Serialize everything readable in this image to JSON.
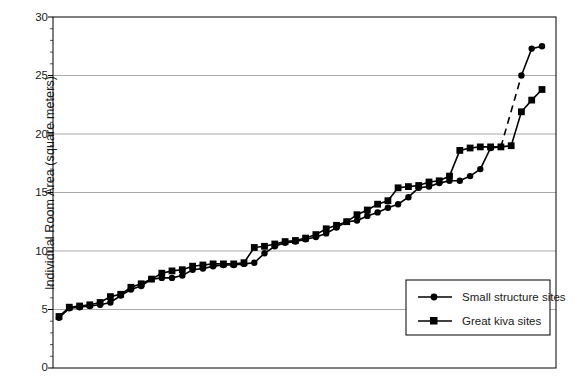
{
  "chart_data": {
    "type": "line",
    "title": "",
    "xlabel": "",
    "ylabel": "Individual Room Area (square meters)",
    "ylim": [
      0,
      30
    ],
    "yticks": [
      0,
      5,
      10,
      15,
      20,
      25,
      30
    ],
    "ytick_labels": [
      "0",
      "5",
      "10",
      "15",
      "20",
      "25",
      "30"
    ],
    "grid": "horizontal",
    "xaxis_ticks": false,
    "legend_position": "bottom-right",
    "series": [
      {
        "name": "Small structure sites",
        "marker": "circle",
        "color": "#000000",
        "x": [
          1,
          2,
          3,
          4,
          5,
          6,
          7,
          8,
          9,
          10,
          11,
          12,
          13,
          14,
          15,
          16,
          17,
          18,
          19,
          20,
          21,
          22,
          23,
          24,
          25,
          26,
          27,
          28,
          29,
          30,
          31,
          32,
          33,
          34,
          35,
          36,
          37,
          38,
          39,
          40,
          41,
          42,
          43,
          44
        ],
        "values": [
          4.3,
          5.1,
          5.2,
          5.3,
          5.4,
          5.6,
          6.2,
          6.7,
          7.0,
          7.6,
          7.7,
          7.7,
          7.9,
          8.4,
          8.5,
          8.7,
          8.8,
          8.8,
          8.9,
          9.0,
          9.8,
          10.4,
          10.7,
          10.8,
          11.0,
          11.2,
          11.5,
          12.0,
          12.5,
          12.6,
          13.0,
          13.3,
          13.7,
          14.0,
          14.6,
          15.4,
          15.5,
          15.8,
          16.0,
          16.0,
          16.4,
          17.0,
          18.8,
          18.9
        ],
        "gap_after_index": 43,
        "tail_values": [
          25.0,
          27.3,
          27.5
        ],
        "tail_x": [
          46,
          47,
          48
        ]
      },
      {
        "name": "Great kiva sites",
        "marker": "square",
        "color": "#000000",
        "x": [
          1,
          2,
          3,
          4,
          5,
          6,
          7,
          8,
          9,
          10,
          11,
          12,
          13,
          14,
          15,
          16,
          17,
          18,
          19,
          20,
          21,
          22,
          23,
          24,
          25,
          26,
          27,
          28,
          29,
          30,
          31,
          32,
          33,
          34,
          35,
          36,
          37,
          38,
          39,
          40,
          41,
          42,
          43,
          44,
          45,
          46,
          47,
          48
        ],
        "values": [
          4.4,
          5.2,
          5.3,
          5.4,
          5.6,
          6.1,
          6.3,
          6.9,
          7.2,
          7.6,
          8.1,
          8.3,
          8.4,
          8.7,
          8.8,
          8.9,
          8.9,
          8.9,
          9.0,
          10.3,
          10.4,
          10.6,
          10.8,
          10.9,
          11.1,
          11.4,
          11.9,
          12.2,
          12.5,
          13.1,
          13.5,
          14.0,
          14.3,
          15.4,
          15.5,
          15.6,
          15.9,
          16.0,
          16.4,
          18.6,
          18.8,
          18.9,
          18.9,
          18.9,
          19.0,
          21.9,
          22.9,
          23.8
        ]
      }
    ]
  },
  "legend": {
    "entries": [
      {
        "label": "Small structure sites",
        "marker": "circle"
      },
      {
        "label": "Great kiva sites",
        "marker": "square"
      }
    ]
  }
}
